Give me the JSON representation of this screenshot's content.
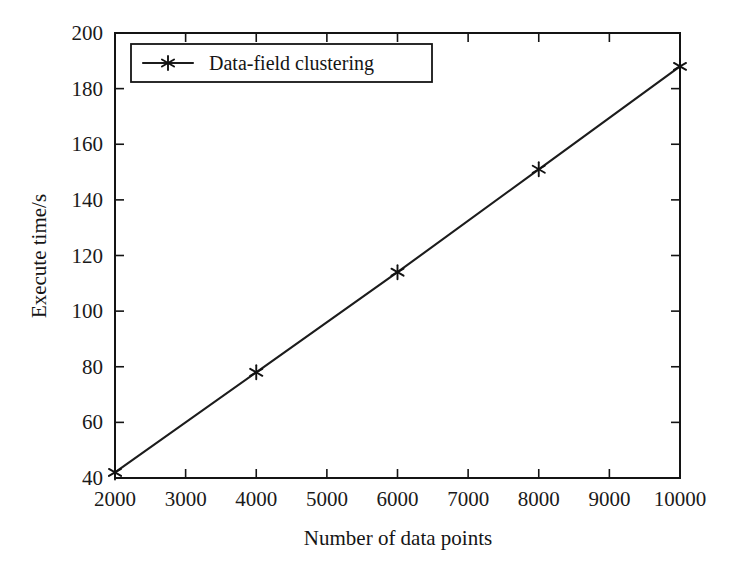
{
  "chart_data": {
    "type": "line",
    "title": "",
    "xlabel": "Number of data points",
    "ylabel": "Execute time/s",
    "xlim": [
      2000,
      10000
    ],
    "ylim": [
      40,
      200
    ],
    "xticks": [
      2000,
      3000,
      4000,
      5000,
      6000,
      7000,
      8000,
      9000,
      10000
    ],
    "yticks": [
      40,
      60,
      80,
      100,
      120,
      140,
      160,
      180,
      200
    ],
    "xtick_labels": [
      "2000",
      "3000",
      "4000",
      "5000",
      "6000",
      "7000",
      "8000",
      "9000",
      "10000"
    ],
    "ytick_labels": [
      "40",
      "60",
      "80",
      "100",
      "120",
      "140",
      "160",
      "180",
      "200"
    ],
    "grid": false,
    "legend_position": "upper left",
    "frame": "box",
    "tick_direction": "in",
    "series": [
      {
        "name": "Data-field clustering",
        "marker": "asterisk",
        "color": "#1c1c1c",
        "x": [
          2000,
          4000,
          6000,
          8000,
          10000
        ],
        "values": [
          42,
          78,
          114,
          151,
          188
        ]
      }
    ]
  },
  "legend": {
    "entries": [
      {
        "label": "Data-field clustering",
        "marker_icon": "asterisk-marker-icon"
      }
    ]
  },
  "axes": {
    "y_title": "Execute time/s",
    "x_title": "Number of data points"
  },
  "colors": {
    "line": "#1c1c1c",
    "axis": "#141414",
    "text": "#1a1a1a",
    "background": "#ffffff"
  }
}
